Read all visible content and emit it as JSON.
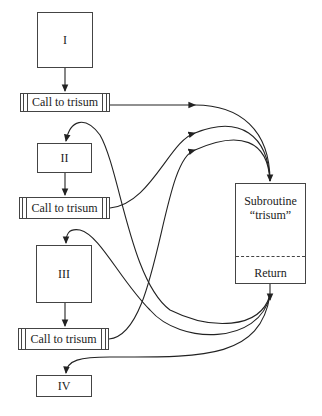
{
  "diagram": {
    "blocks": [
      {
        "id": "I",
        "label": "I"
      },
      {
        "id": "II",
        "label": "II"
      },
      {
        "id": "III",
        "label": "III"
      },
      {
        "id": "IV",
        "label": "IV"
      }
    ],
    "calls": [
      {
        "label": "Call to trisum"
      },
      {
        "label": "Call to trisum"
      },
      {
        "label": "Call to trisum"
      }
    ],
    "subroutine": {
      "title_line1": "Subroutine",
      "title_line2": "“trisum”",
      "return_label": "Return"
    },
    "colors": {
      "line": "#222222",
      "background": "#ffffff"
    }
  }
}
